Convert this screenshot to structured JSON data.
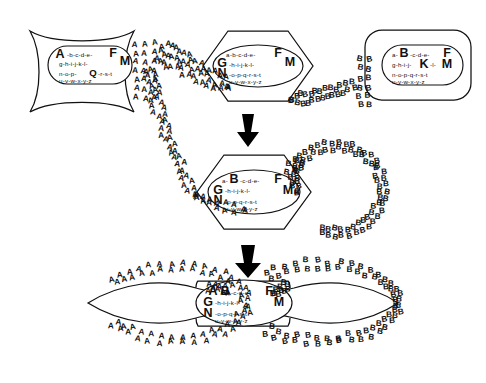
{
  "diagram": {
    "background_color": "#ffffff",
    "ink_color": "#111111",
    "arrow_color": "#000000"
  },
  "alphabet_rows": {
    "row1": "a-b-c-d-e-",
    "row2": "g-h-i-j-k-l-",
    "row3": "n-o-p-q-r-s-t",
    "row4": "u-v-w-x-y-z"
  },
  "cells": [
    {
      "id": "cell-top-left",
      "shape": "concave-rounded-square",
      "marker_letter": "A",
      "emphasis": [
        "A",
        "F",
        "M",
        "Q"
      ],
      "nucleus_shape": "rounded-rect",
      "secretes": "A",
      "nucleus_text": {
        "line1_pre": "A",
        "line1_mid": "-b-c-d-e-",
        "line1_end": "F",
        "line1_tail": "M",
        "line2": "g-h-i-j-k-l-",
        "line3_pre": "n-o-p-",
        "line3_cap": "Q",
        "line3_post": "-r-s-t",
        "line4": "u-v-w-x-y-z"
      }
    },
    {
      "id": "cell-top-middle",
      "shape": "hexagon",
      "marker_letter": "",
      "emphasis": [
        "G",
        "N",
        "F",
        "M"
      ],
      "nucleus_shape": "ellipse",
      "secretes": "",
      "nucleus_text": {
        "line1_pre": "a",
        "line1_mid": "-b-c-d-e-",
        "line1_end": "F",
        "line1_tail": "M",
        "line2_cap": "G",
        "line2": "-h-i-j-k-l-",
        "line3_cap": "N",
        "line3": "-o-p-q-r-s-t",
        "line4": "u-v-w-x-y-z"
      }
    },
    {
      "id": "cell-top-right",
      "shape": "rounded-rect",
      "marker_letter": "B",
      "emphasis": [
        "B",
        "F",
        "K",
        "M"
      ],
      "nucleus_shape": "rounded-rect",
      "secretes": "B",
      "nucleus_text": {
        "line1_pre": "a-",
        "line1_cap": "B",
        "line1_mid": "-c-d-e-",
        "line1_end": "F",
        "line2": "g-h-i-j-",
        "line2_cap": "K",
        "line2_post": "-l-",
        "line2_tail": "M",
        "line3": "n-o-p-q-r-s-t",
        "line4": "u-v-w-x-y-z"
      }
    },
    {
      "id": "cell-middle-fused",
      "shape": "hexagon",
      "marker_letter": "",
      "emphasis": [
        "B",
        "F",
        "G",
        "M",
        "N"
      ],
      "nucleus_shape": "ellipse",
      "secretes": "B",
      "nucleus_text": {
        "line1_pre": "a-",
        "line1_cap": "B",
        "line1_mid": "-c-d-e-",
        "line1_end": "F",
        "line2_cap": "G",
        "line2": "-h-i-j-k-l-",
        "line2_tail": "M",
        "line3_cap": "N",
        "line3": "-o-p-q-r-s-t",
        "line4": "u-v-w-x-y-z"
      }
    },
    {
      "id": "cell-bottom-hybrid",
      "shape": "lens-spindle",
      "marker_letter": "",
      "emphasis": [
        "A",
        "B",
        "F",
        "G",
        "M",
        "N"
      ],
      "nucleus_shape": "ellipse",
      "secretes": "A and B",
      "nucleus_text": {
        "line1_cap1": "A",
        "line1_cap2": "B",
        "line1_mid": "-c-d-e-",
        "line1_end": "F",
        "line2_cap": "G",
        "line2": "-h-i-j-k-l-",
        "line2_tail": "M",
        "line3_cap": "N",
        "line3": "-o-p-q-r-s-t",
        "line4": "u-v-w-x-y-z"
      }
    }
  ],
  "trails": [
    {
      "id": "trail-a-top",
      "letter": "A",
      "from": "cell-top-left",
      "to": "cell-middle-fused"
    },
    {
      "id": "trail-b-top",
      "letter": "B",
      "from": "cell-top-right",
      "to": "cell-middle-fused"
    },
    {
      "id": "trail-b-loop-middle",
      "letter": "B",
      "from": "cell-middle-fused",
      "to": "cell-middle-fused"
    },
    {
      "id": "trail-a-loop-bottom",
      "letter": "A",
      "from": "cell-bottom-hybrid",
      "to": "cell-bottom-hybrid"
    },
    {
      "id": "trail-b-loop-bottom",
      "letter": "B",
      "from": "cell-bottom-hybrid",
      "to": "cell-bottom-hybrid"
    }
  ],
  "arrows": [
    {
      "id": "arrow-step-1",
      "direction": "down",
      "x": 248,
      "y": 112
    },
    {
      "id": "arrow-step-2",
      "direction": "down",
      "x": 248,
      "y": 243
    }
  ]
}
